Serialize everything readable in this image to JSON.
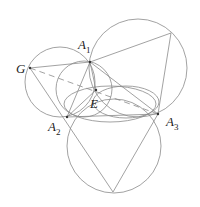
{
  "diagram": {
    "points": {
      "G": {
        "label": "G",
        "x": 30,
        "y": 68
      },
      "A1": {
        "label": "A",
        "sub": "1",
        "x": 90,
        "y": 62
      },
      "A2": {
        "label": "A",
        "sub": "2",
        "x": 67,
        "y": 117
      },
      "A3": {
        "label": "A",
        "sub": "3",
        "x": 158,
        "y": 114
      },
      "E": {
        "label": "E",
        "x": 96,
        "y": 90
      }
    },
    "stroke_color": "#8a8a8a",
    "dashed_segment": "G-A3"
  }
}
